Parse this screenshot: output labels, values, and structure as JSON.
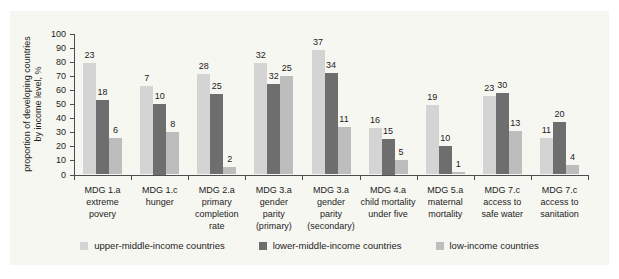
{
  "figure": {
    "y_axis_title": "proportion of developing countries\nby income level, %"
  },
  "chart_data": {
    "type": "bar",
    "title": "",
    "ylabel": "proportion of developing countries by income level, %",
    "xlabel": "",
    "ylim": [
      0,
      100
    ],
    "y_ticks": [
      0,
      10,
      20,
      30,
      40,
      50,
      60,
      70,
      80,
      90,
      100
    ],
    "grid": false,
    "legend_position": "bottom",
    "categories": [
      [
        "MDG 1.a",
        "extreme",
        "povery"
      ],
      [
        "MDG 1.c",
        "hunger"
      ],
      [
        "MDG 2.a",
        "primary",
        "completion",
        "rate"
      ],
      [
        "MDG 3.a",
        "gender",
        "parity",
        "(primary)"
      ],
      [
        "MDG 3.a",
        "gender",
        "parity",
        "(secondary)"
      ],
      [
        "MDG 4.a",
        "child mortality",
        "under five"
      ],
      [
        "MDG 5.a",
        "maternal",
        "mortality"
      ],
      [
        "MDG 7.c",
        "access to",
        "safe water"
      ],
      [
        "MDG 7.c",
        "access to",
        "sanitation"
      ]
    ],
    "series": [
      {
        "name": "upper-middle-income countries",
        "color": "#d4d4d4",
        "values": [
          79,
          63,
          71,
          79,
          88,
          33,
          49,
          56,
          26
        ],
        "bar_labels": [
          23,
          7,
          28,
          32,
          37,
          16,
          19,
          23,
          11
        ]
      },
      {
        "name": "lower-middle-income countries",
        "color": "#6e6e6e",
        "values": [
          53,
          50,
          57,
          64,
          72,
          25,
          20,
          58,
          37
        ],
        "bar_labels": [
          18,
          10,
          25,
          32,
          34,
          15,
          10,
          30,
          20
        ]
      },
      {
        "name": "low-income countries",
        "color": "#bdbdbd",
        "values": [
          26,
          30,
          5,
          70,
          34,
          10,
          2,
          31,
          7
        ],
        "bar_labels": [
          6,
          8,
          2,
          25,
          11,
          5,
          1,
          13,
          4
        ]
      }
    ]
  }
}
